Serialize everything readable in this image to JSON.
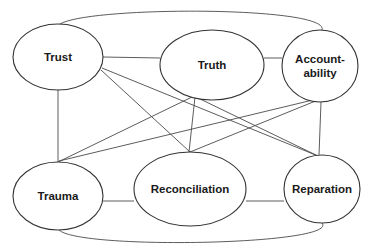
{
  "diagram": {
    "type": "relationship-network",
    "nodes": [
      {
        "id": "trust",
        "label": [
          "Trust"
        ],
        "cx": 58,
        "cy": 57,
        "rx": 45,
        "ry": 33
      },
      {
        "id": "truth",
        "label": [
          "Truth"
        ],
        "cx": 212,
        "cy": 65,
        "rx": 52,
        "ry": 35
      },
      {
        "id": "accountability",
        "label": [
          "Account-",
          "ability"
        ],
        "cx": 320,
        "cy": 66,
        "rx": 38,
        "ry": 36
      },
      {
        "id": "trauma",
        "label": [
          "Trauma"
        ],
        "cx": 58,
        "cy": 196,
        "rx": 45,
        "ry": 34
      },
      {
        "id": "reconciliation",
        "label": [
          "Reconciliation"
        ],
        "cx": 190,
        "cy": 189,
        "rx": 56,
        "ry": 37
      },
      {
        "id": "reparation",
        "label": [
          "Reparation"
        ],
        "cx": 322,
        "cy": 189,
        "rx": 38,
        "ry": 34
      }
    ],
    "edges": [
      {
        "from": "trust",
        "to": "truth",
        "d": "M103,57 L160,58"
      },
      {
        "from": "truth",
        "to": "accountability",
        "d": "M264,58 L282,58"
      },
      {
        "from": "trauma",
        "to": "reconciliation",
        "d": "M103,201 L134,201"
      },
      {
        "from": "reconciliation",
        "to": "reparation",
        "d": "M246,201 L284,201"
      },
      {
        "from": "trust",
        "to": "trauma",
        "d": "M58,90 L58,162"
      },
      {
        "from": "accountability",
        "to": "reparation",
        "d": "M321,102 L319,155"
      },
      {
        "from": "trust",
        "to": "reconciliation",
        "d": "M101,70 L190,152"
      },
      {
        "from": "trust",
        "to": "reparation",
        "d": "M102,68 L318,156"
      },
      {
        "from": "truth",
        "to": "trauma",
        "d": "M192,97 L58,162"
      },
      {
        "from": "truth",
        "to": "reconciliation",
        "d": "M195,97 L189,152"
      },
      {
        "from": "truth",
        "to": "reparation",
        "d": "M198,98 L318,156"
      },
      {
        "from": "accountability",
        "to": "trauma",
        "d": "M317,99 L59,161"
      },
      {
        "from": "accountability",
        "to": "reconciliation",
        "d": "M318,100 L190,152"
      },
      {
        "from": "trust",
        "to": "accountability",
        "curved": true,
        "d": "M60,24 C90,6 330,6 322,30"
      },
      {
        "from": "trauma",
        "to": "reparation",
        "curved": true,
        "d": "M59,230 C80,250 340,245 322,223"
      }
    ]
  }
}
